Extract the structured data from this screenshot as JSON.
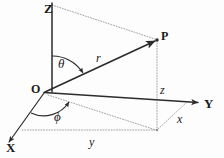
{
  "figure": {
    "background_color": "#fdfdfd",
    "stroke_color": "#2b2b2b",
    "dotted_color": "#9a9a9a"
  },
  "axes": [
    {
      "id": "z",
      "label": "Z",
      "x": 44,
      "y": 2
    },
    {
      "id": "y",
      "label": "Y",
      "x": 204,
      "y": 97
    },
    {
      "id": "x",
      "label": "X",
      "x": 6,
      "y": 141
    }
  ],
  "points": [
    {
      "id": "origin",
      "label": "O",
      "x": 31,
      "y": 83
    },
    {
      "id": "p",
      "label": "P",
      "x": 161,
      "y": 30
    }
  ],
  "measures": [
    {
      "id": "radius",
      "label": "r",
      "x": 96,
      "y": 52
    },
    {
      "id": "theta",
      "label": "θ",
      "x": 58,
      "y": 57
    },
    {
      "id": "phi",
      "label": "ϕ",
      "x": 54,
      "y": 110
    },
    {
      "id": "z-component",
      "label": "z",
      "x": 160,
      "y": 84
    },
    {
      "id": "x-component",
      "label": "x",
      "x": 177,
      "y": 113
    },
    {
      "id": "y-component",
      "label": "y",
      "x": 89,
      "y": 136
    }
  ],
  "geometry": {
    "origin": {
      "x": 44,
      "y": 92
    },
    "z_axis_top": {
      "x": 52,
      "y": 3
    },
    "y_axis_end": {
      "x": 200,
      "y": 103
    },
    "x_axis_end": {
      "x": 8,
      "y": 143
    },
    "point_p": {
      "x": 157,
      "y": 40
    },
    "projection_q": {
      "x": 157,
      "y": 130
    },
    "y_foot": {
      "x": 157,
      "y": 103
    },
    "x_foot": {
      "x": 186,
      "y": 102
    },
    "y_dotted_start": {
      "x": 22,
      "y": 130
    }
  }
}
